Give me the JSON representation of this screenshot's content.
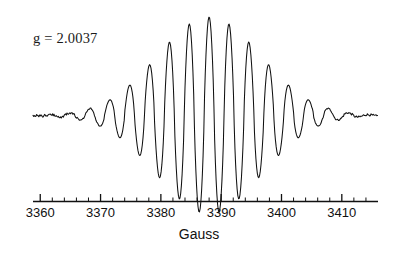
{
  "figure": {
    "annotation": "g = 2.0037",
    "axis_title": "Gauss",
    "line_color": "#111111",
    "background_color": "#ffffff"
  },
  "chart_data": {
    "type": "line",
    "title": "",
    "subtitle": "",
    "xlabel": "Gauss",
    "ylabel": "",
    "xlim": [
      3358.8,
      3416.0
    ],
    "ylim": [
      -1.05,
      1.05
    ],
    "grid": false,
    "legend": null,
    "annotations": [
      {
        "text": "g = 2.0037",
        "x": 3365.5,
        "y": 0.82
      }
    ],
    "x_major_ticks": [
      3360,
      3370,
      3380,
      3390,
      3400,
      3410
    ],
    "x_tick_labels": [
      "3360",
      "3370",
      "3380",
      "3390",
      "3400",
      "3410"
    ],
    "x_minor_tick_step": 2,
    "axis_start": 3360,
    "axis_end": 3415,
    "center_gauss": 3388.0,
    "line_spacing_gauss": 3.3,
    "envelope_width_gauss": 13.2,
    "noise_amplitude": 0.012,
    "series": [
      {
        "name": "EPR derivative signal",
        "peaks": [
          {
            "gauss": 3371.2,
            "amplitude": 0.035
          },
          {
            "gauss": 3374.5,
            "amplitude": 0.075
          },
          {
            "gauss": 3377.8,
            "amplitude": 0.175
          },
          {
            "gauss": 3381.1,
            "amplitude": 0.345
          },
          {
            "gauss": 3384.4,
            "amplitude": 0.585
          },
          {
            "gauss": 3387.7,
            "amplitude": 0.835
          },
          {
            "gauss": 3391.0,
            "amplitude": 0.985
          },
          {
            "gauss": 3394.3,
            "amplitude": 0.985
          },
          {
            "gauss": 3397.6,
            "amplitude": 0.835
          },
          {
            "gauss": 3400.9,
            "amplitude": 0.585
          },
          {
            "gauss": 3404.2,
            "amplitude": 0.345
          },
          {
            "gauss": 3407.5,
            "amplitude": 0.175
          },
          {
            "gauss": 3410.8,
            "amplitude": 0.075
          },
          {
            "gauss": 3414.1,
            "amplitude": 0.035
          }
        ]
      }
    ]
  }
}
